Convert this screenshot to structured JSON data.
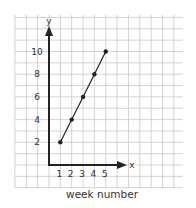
{
  "chart_data": {
    "type": "line",
    "title": "",
    "xlabel": "week number",
    "ylabel": "y",
    "x_axis_letter": "x",
    "x": [
      1,
      2,
      3,
      4,
      5
    ],
    "series": [
      {
        "name": "y",
        "values": [
          2,
          4,
          6,
          8,
          10
        ]
      }
    ],
    "x_ticks": [
      "1",
      "2",
      "3",
      "4",
      "5"
    ],
    "y_ticks": [
      "2",
      "4",
      "6",
      "8",
      "10"
    ],
    "xlim": [
      0,
      5
    ],
    "ylim": [
      0,
      10
    ],
    "grid": true,
    "legend": "none",
    "colors": {
      "line": "#222222",
      "grid": "#c8c8c8",
      "axis": "#222222",
      "background": "#ffffff"
    }
  }
}
